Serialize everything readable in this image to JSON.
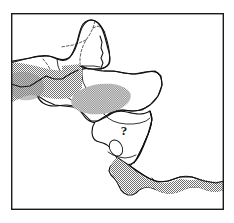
{
  "figure": {
    "kind": "distribution-range-map",
    "region": "Central America",
    "frame": {
      "x": 11,
      "y": 13,
      "width": 213,
      "height": 197,
      "stroke": "#1a1a1a"
    },
    "background_color": "#ffffff",
    "land_fill": "#ffffff",
    "coast_stroke": "#111111",
    "range_fill": "#8a8a8a",
    "range_pattern": "stipple-dot-halftone",
    "annotations": [
      {
        "name": "uncertain-occurrence-marker",
        "text": "?",
        "x": 124,
        "y": 135,
        "meaning": "uncertain / unconfirmed occurrence"
      }
    ],
    "range_polygons": [
      {
        "name": "range-patch-chiapas-guatemala",
        "label": "northern stippled range lobe"
      },
      {
        "name": "range-patch-honduras",
        "label": "central stippled range lobe"
      },
      {
        "name": "range-patch-costa-rica-panama",
        "label": "southern stippled range band"
      }
    ],
    "country_borders": [
      {
        "name": "border-mexico-guatemala",
        "style": "solid"
      },
      {
        "name": "border-mexico-belize",
        "style": "solid"
      },
      {
        "name": "border-guatemala-honduras",
        "style": "solid"
      },
      {
        "name": "border-guatemala-el-salvador",
        "style": "solid"
      },
      {
        "name": "border-honduras-nicaragua",
        "style": "solid"
      },
      {
        "name": "border-nicaragua-costa-rica",
        "style": "solid"
      },
      {
        "name": "border-costa-rica-panama",
        "style": "solid"
      },
      {
        "name": "border-yucatan-states",
        "style": "dashed"
      }
    ],
    "water_bodies": [
      {
        "name": "lake-nicaragua"
      }
    ]
  }
}
